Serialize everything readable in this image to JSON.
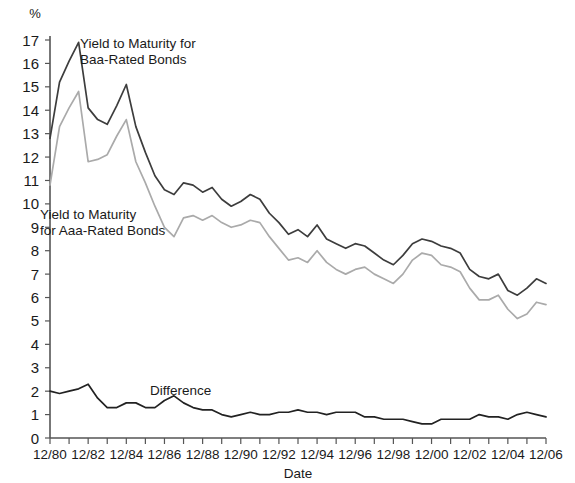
{
  "chart_data": {
    "type": "line",
    "title": "",
    "xlabel": "Date",
    "ylabel": "%",
    "ylim": [
      0,
      17.4
    ],
    "grid": false,
    "legend_position": "inline-annotations",
    "y_ticks": [
      0,
      1,
      2,
      3,
      4,
      5,
      6,
      7,
      8,
      9,
      10,
      11,
      12,
      13,
      14,
      15,
      16,
      17
    ],
    "y_tick_labels": [
      "0",
      "1",
      "2",
      "3",
      "4",
      "5",
      "6",
      "7",
      "8",
      "9",
      "10",
      "11",
      "12",
      "13",
      "14",
      "15",
      "16",
      "17"
    ],
    "x_tick_labels": [
      "12/80",
      "12/82",
      "12/84",
      "12/86",
      "12/88",
      "12/90",
      "12/92",
      "12/94",
      "12/96",
      "12/98",
      "12/00",
      "12/02",
      "12/04",
      "12/06"
    ],
    "x_minor_tick_count": 27,
    "x": [
      "12/80",
      "06/81",
      "12/81",
      "06/82",
      "12/82",
      "06/83",
      "12/83",
      "06/84",
      "12/84",
      "06/85",
      "12/85",
      "06/86",
      "12/86",
      "06/87",
      "12/87",
      "06/88",
      "12/88",
      "06/89",
      "12/89",
      "06/90",
      "12/90",
      "06/91",
      "12/91",
      "06/92",
      "12/92",
      "06/93",
      "12/93",
      "06/94",
      "12/94",
      "06/95",
      "12/95",
      "06/96",
      "12/96",
      "06/97",
      "12/97",
      "06/98",
      "12/98",
      "06/99",
      "12/99",
      "06/00",
      "12/00",
      "06/01",
      "12/01",
      "06/02",
      "12/02",
      "06/03",
      "12/03",
      "06/04",
      "12/04",
      "06/05",
      "12/05",
      "06/06",
      "12/06"
    ],
    "series": [
      {
        "name": "Yield to Maturity for Baa-Rated Bonds",
        "color": "#3d3d3d",
        "values": [
          12.8,
          15.2,
          16.1,
          16.9,
          14.1,
          13.6,
          13.4,
          14.2,
          15.1,
          13.3,
          12.2,
          11.2,
          10.6,
          10.4,
          10.9,
          10.8,
          10.5,
          10.7,
          10.2,
          9.9,
          10.1,
          10.4,
          10.2,
          9.6,
          9.2,
          8.7,
          8.9,
          8.6,
          9.1,
          8.5,
          8.3,
          8.1,
          8.3,
          8.2,
          7.9,
          7.6,
          7.4,
          7.8,
          8.3,
          8.5,
          8.4,
          8.2,
          8.1,
          7.9,
          7.2,
          6.9,
          6.8,
          7.0,
          6.3,
          6.1,
          6.4,
          6.8,
          6.6
        ],
        "linewidth": 1.7
      },
      {
        "name": "Yield to Maturity for Aaa-Rated Bonds",
        "color": "#aaaaaa",
        "values": [
          10.8,
          13.3,
          14.1,
          14.8,
          11.8,
          11.9,
          12.1,
          12.9,
          13.6,
          11.8,
          10.9,
          9.9,
          9.0,
          8.6,
          9.4,
          9.5,
          9.3,
          9.5,
          9.2,
          9.0,
          9.1,
          9.3,
          9.2,
          8.6,
          8.1,
          7.6,
          7.7,
          7.5,
          8.0,
          7.5,
          7.2,
          7.0,
          7.2,
          7.3,
          7.0,
          6.8,
          6.6,
          7.0,
          7.6,
          7.9,
          7.8,
          7.4,
          7.3,
          7.1,
          6.4,
          5.9,
          5.9,
          6.1,
          5.5,
          5.1,
          5.3,
          5.8,
          5.7
        ],
        "linewidth": 1.7
      },
      {
        "name": "Difference",
        "color": "#222222",
        "values": [
          2.0,
          1.9,
          2.0,
          2.1,
          2.3,
          1.7,
          1.3,
          1.3,
          1.5,
          1.5,
          1.3,
          1.3,
          1.6,
          1.8,
          1.5,
          1.3,
          1.2,
          1.2,
          1.0,
          0.9,
          1.0,
          1.1,
          1.0,
          1.0,
          1.1,
          1.1,
          1.2,
          1.1,
          1.1,
          1.0,
          1.1,
          1.1,
          1.1,
          0.9,
          0.9,
          0.8,
          0.8,
          0.8,
          0.7,
          0.6,
          0.6,
          0.8,
          0.8,
          0.8,
          0.8,
          1.0,
          0.9,
          0.9,
          0.8,
          1.0,
          1.1,
          1.0,
          0.9
        ],
        "linewidth": 1.7
      }
    ],
    "annotations": [
      {
        "id": "baa-label",
        "text_lines": [
          "Yield to Maturity for",
          "Baa-Rated Bonds"
        ],
        "x_px": 80,
        "y_px": 48
      },
      {
        "id": "aaa-label",
        "text_lines": [
          "Yield to Maturity",
          "for Aaa-Rated Bonds"
        ],
        "x_px": 40,
        "y_px": 219
      },
      {
        "id": "difference-label",
        "text_lines": [
          "Difference"
        ],
        "x_px": 150,
        "y_px": 395
      }
    ]
  }
}
